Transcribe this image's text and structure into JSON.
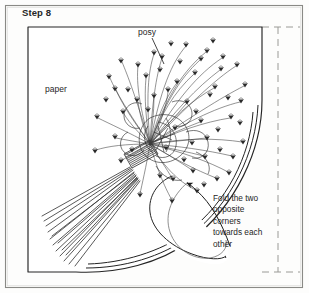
{
  "figure": {
    "step_title": "Step 8",
    "labels": {
      "paper": "paper",
      "posy": "posy"
    },
    "instruction_lines": [
      "Fold the two",
      "opposite",
      "corners",
      "towards each",
      "other"
    ],
    "instruction_text": "Fold the two opposite corners towards each other",
    "colors": {
      "background": "#fdfdfc",
      "ink": "#1a1a1a",
      "line": "#2b2b2b",
      "dashed_guide": "#8f8f8f",
      "frame": "#6e6e6e"
    },
    "elements": {
      "outer_frame": "figure-border",
      "paper_sheet": "paper-sheet-outline",
      "fold_guide": "dashed-fold-guide",
      "bouquet": "posy-bouquet",
      "binding": "stem-binding-wrap",
      "stems": "stem-bundle",
      "arrow": "fold-direction-arrow",
      "leader_posy": "posy-leader-line"
    }
  }
}
